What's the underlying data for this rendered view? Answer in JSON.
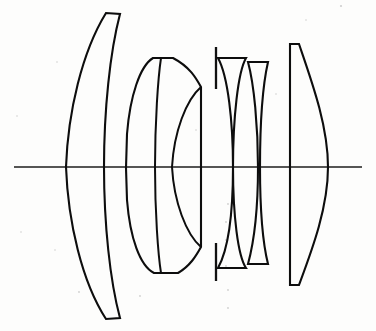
{
  "figure": {
    "kind": "optical-layout-diagram",
    "width": 376,
    "height": 331,
    "background_color": "#fdfdfc",
    "ink_color": "#0d0d0d",
    "axis_color": "#4a4a4a",
    "caption": "",
    "labels": []
  },
  "optical_axis": {
    "name": "optical-axis",
    "y": 167,
    "x_start": 14,
    "x_end": 362,
    "color": "#4a4a4a",
    "stroke_width": 1.5
  },
  "aperture_stop": {
    "name": "aperture-stop",
    "x": 216,
    "upper_top_y": 47,
    "upper_bottom_y": 89,
    "lower_top_y": 243,
    "lower_bottom_y": 281,
    "color": "#111111"
  },
  "groups": [
    {
      "id": "group-1",
      "label": "Front meniscus element",
      "element_count": 1,
      "axis_left_x": 66,
      "axis_right_x": 104,
      "top_y": 13,
      "bottom_y": 319,
      "shape": "negative-meniscus"
    },
    {
      "id": "group-2",
      "label": "Cemented doublet",
      "element_count": 2,
      "axis_left_x": 155,
      "axis_cement_x": 166,
      "axis_right_x": 201,
      "top_y": 58,
      "bottom_y": 273,
      "shape": "biconvex-doublet"
    },
    {
      "id": "group-3",
      "label": "Rear cemented doublet",
      "element_count": 2,
      "axis_left_x": 233,
      "axis_cement_x": 258,
      "axis_right_x": 266,
      "top_y": 58,
      "bottom_y": 268,
      "shape": "meniscus-doublet"
    },
    {
      "id": "group-4",
      "label": "Rear convex element",
      "element_count": 1,
      "axis_left_x": 288,
      "axis_right_x": 328,
      "top_y": 44,
      "bottom_y": 285,
      "shape": "plano-convex"
    }
  ],
  "paths": {
    "g1_outline": "M 106 13 C 82 52, 68 112, 66 167 C 68 222, 82 282, 106 319 L 120 318 C 110 281, 104 224, 104 167 C 104 110, 110 52, 120 14 Z",
    "g2_outer": "M 153 58 C 140 66, 130 96, 127 134 L 126 168 L 127 200 C 130 238, 140 266, 154 273 L 178 273 C 190 266, 196 256, 201 247 L 201 87 C 196 78, 190 67, 173 58 Z",
    "g2_cement": "M 161 58 C 158 78, 155 122, 155 167 C 155 212, 158 254, 161 273",
    "g2_right_inner": "M 201 87 C 186 100, 174 132, 172 167 C 174 202, 186 234, 201 247",
    "g3a_outline": "M 218 58 L 246 58 C 238 72, 233 118, 233 167 C 233 216, 238 256, 246 268 L 218 268 C 228 250, 233 212, 233 167 C 233 122, 228 76, 218 58 Z",
    "g3b_outline": "M 248 62 L 268 62 C 263 84, 260 124, 260 167 C 260 210, 263 244, 268 264 L 248 264 C 254 242, 258 208, 258 167 C 258 126, 254 84, 248 62 Z",
    "g4_outline": "M 290 44 L 299 44 C 312 82, 328 126, 328 167 C 328 208, 312 250, 299 285 L 290 285 L 290 44 Z",
    "g4_left": "M 290 44 L 290 285"
  },
  "speckles": [
    {
      "x": 341,
      "y": 6,
      "r": 1.1
    },
    {
      "x": 228,
      "y": 204,
      "r": 0.9
    },
    {
      "x": 226,
      "y": 222,
      "r": 0.9
    },
    {
      "x": 226,
      "y": 240,
      "r": 0.9
    },
    {
      "x": 226,
      "y": 266,
      "r": 0.9
    },
    {
      "x": 228,
      "y": 290,
      "r": 0.9
    },
    {
      "x": 228,
      "y": 308,
      "r": 0.9
    },
    {
      "x": 79,
      "y": 292,
      "r": 0.9
    },
    {
      "x": 140,
      "y": 296,
      "r": 0.9
    },
    {
      "x": 17,
      "y": 116,
      "r": 0.8
    },
    {
      "x": 21,
      "y": 232,
      "r": 0.8
    },
    {
      "x": 55,
      "y": 250,
      "r": 0.8
    },
    {
      "x": 57,
      "y": 62,
      "r": 0.8
    },
    {
      "x": 196,
      "y": 130,
      "r": 0.8
    },
    {
      "x": 276,
      "y": 94,
      "r": 0.8
    },
    {
      "x": 306,
      "y": 20,
      "r": 0.8
    }
  ]
}
